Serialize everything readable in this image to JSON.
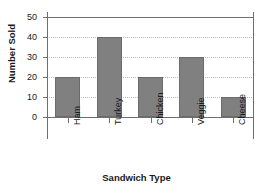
{
  "chart_data": {
    "type": "bar",
    "title": "Sandwiches Sold",
    "xlabel": "Sandwich Type",
    "ylabel": "Number Sold",
    "categories": [
      "Ham",
      "Turkey",
      "Chicken",
      "Veggie",
      "Cheese"
    ],
    "values": [
      20,
      40,
      20,
      30,
      10
    ],
    "yticks": [
      0,
      10,
      20,
      30,
      40,
      50
    ],
    "ylim": [
      0,
      50
    ],
    "grid": true,
    "grid_axis": "y",
    "legend": false,
    "bar_color": "#808080",
    "bar_edge_color": "#6b6b6b",
    "axis_color": "#6e6e6e",
    "gridline_color": "#b9b9b9",
    "background_color": "#ffffff"
  }
}
